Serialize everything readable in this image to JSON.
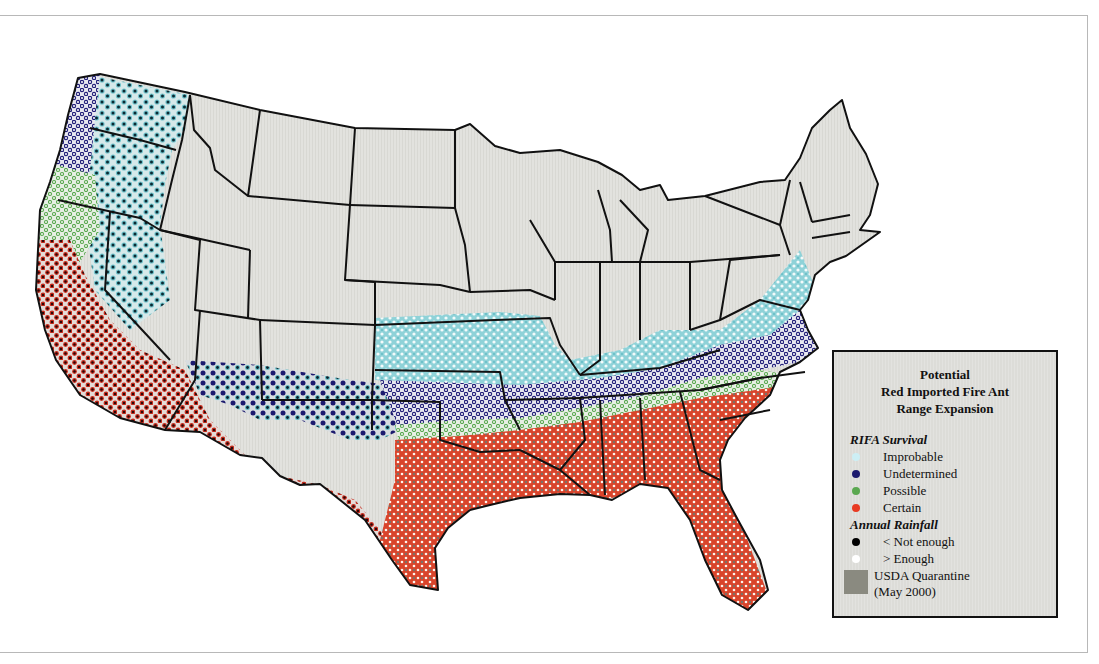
{
  "legend": {
    "title_lines": [
      "Potential",
      "Red Imported Fire Ant",
      "Range Expansion"
    ],
    "survival_heading": "RIFA Survival",
    "survival_items": [
      {
        "label": "Improbable",
        "color": "#cdeff5"
      },
      {
        "label": "Undetermined",
        "color": "#1c1a6e"
      },
      {
        "label": "Possible",
        "color": "#5aa850"
      },
      {
        "label": "Certain",
        "color": "#e83a22"
      }
    ],
    "rainfall_heading": "Annual Rainfall",
    "rainfall_items": [
      {
        "label": "< Not enough",
        "color": "#000000"
      },
      {
        "label": "> Enough",
        "color": "#ffffff"
      }
    ],
    "quarantine": {
      "label_line1": "USDA Quarantine",
      "label_line2": "(May 2000)",
      "color": "#8a8a80"
    }
  },
  "map": {
    "land_color": "#e2e2de",
    "border_color": "#111111",
    "regions": [
      {
        "name": "Pacific Northwest interior",
        "survival": "Improbable",
        "rainfall": "Not enough"
      },
      {
        "name": "Pacific coast",
        "survival": "Possible/Undetermined",
        "rainfall": "Enough"
      },
      {
        "name": "California & Southwest deserts",
        "survival": "Certain",
        "rainfall": "Not enough"
      },
      {
        "name": "Great Basin / Four Corners",
        "survival": "Improbable/Undetermined",
        "rainfall": "Not enough"
      },
      {
        "name": "Kansas / Missouri band",
        "survival": "Improbable",
        "rainfall": "Enough"
      },
      {
        "name": "Mid-south band",
        "survival": "Undetermined",
        "rainfall": "Enough"
      },
      {
        "name": "Southeast & Gulf",
        "survival": "Certain",
        "rainfall": "Enough",
        "quarantine": true
      }
    ]
  }
}
